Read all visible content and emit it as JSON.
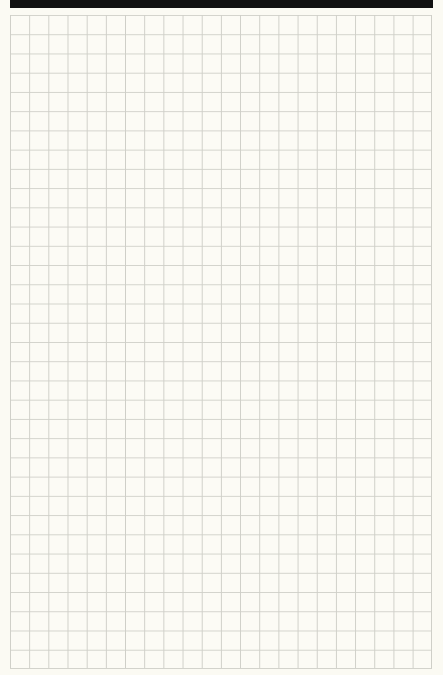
{
  "page": {
    "type": "grid-paper",
    "columns": 22,
    "rows": 34,
    "cell_size_px": 19,
    "colors": {
      "background": "#fbfaf3",
      "grid_line": "#cfcfc8",
      "top_bar": "#111111"
    }
  }
}
